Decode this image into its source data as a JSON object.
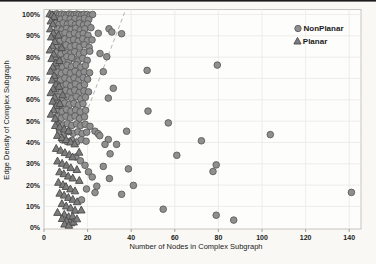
{
  "figure": {
    "width": 376,
    "height": 264,
    "background": "#f9f8f5",
    "top_rule_color": "#1b1b1b",
    "plot_background": "#fdfdfc",
    "plot_border_color": "#c6c4c0",
    "grid_color": "#ebe9e4",
    "tick_color": "#8b8b8b",
    "text_color": "#1a1a1a"
  },
  "chart_data": {
    "type": "scatter",
    "title": "",
    "xlabel": "Number of Nodes in Complex Subgraph",
    "ylabel": "Edge Density of Complex Subgraph",
    "xlim": [
      0,
      145
    ],
    "ylim": [
      0,
      102
    ],
    "x_ticks": [
      0,
      20,
      40,
      60,
      80,
      100,
      120,
      140
    ],
    "x_tick_labels": [
      "0",
      "20",
      "40",
      "60",
      "80",
      "100",
      "120",
      "140"
    ],
    "y_ticks": [
      0,
      10,
      20,
      30,
      40,
      50,
      60,
      70,
      80,
      90,
      100
    ],
    "y_tick_labels": [
      "0%",
      "10%",
      "20%",
      "30%",
      "40%",
      "50%",
      "60%",
      "70%",
      "80%",
      "90%",
      "100%"
    ],
    "grid": true,
    "legend": {
      "position": "top-right",
      "entries": [
        {
          "label": "NonPlanar",
          "marker": "circle"
        },
        {
          "label": "Planar",
          "marker": "triangle"
        }
      ]
    },
    "trend_line": {
      "style": "dashed",
      "color": "#b6b4b0",
      "x1": 13.5,
      "y1": 38,
      "x2": 37,
      "y2": 101
    },
    "series": [
      {
        "name": "NonPlanar",
        "marker": "circle",
        "fill": "#8f8f8f",
        "stroke": "#5c5c5c",
        "points": [
          [
            4.8,
            100
          ],
          [
            5.9,
            100.3
          ],
          [
            7,
            99.8
          ],
          [
            8.1,
            100.2
          ],
          [
            9.3,
            100
          ],
          [
            10.4,
            99.7
          ],
          [
            11.5,
            100.2
          ],
          [
            12.7,
            100
          ],
          [
            13.8,
            99.8
          ],
          [
            15,
            100.2
          ],
          [
            16.1,
            100
          ],
          [
            17.3,
            99.7
          ],
          [
            18.4,
            100.1
          ],
          [
            19.8,
            100
          ],
          [
            21.2,
            99.6
          ],
          [
            22.3,
            100
          ],
          [
            5.4,
            98.2
          ],
          [
            7.6,
            97.8
          ],
          [
            9.8,
            98.3
          ],
          [
            12,
            97.9
          ],
          [
            14.2,
            98.1
          ],
          [
            16.4,
            97.7
          ],
          [
            18.6,
            98.2
          ],
          [
            20.5,
            97.6
          ],
          [
            5.1,
            95.8
          ],
          [
            6.9,
            95.2
          ],
          [
            8.8,
            96
          ],
          [
            10.7,
            95.4
          ],
          [
            12.5,
            96.1
          ],
          [
            14.4,
            95.3
          ],
          [
            16.2,
            95.9
          ],
          [
            18.1,
            95.1
          ],
          [
            20,
            95.6
          ],
          [
            6.2,
            93.4
          ],
          [
            8.3,
            92.8
          ],
          [
            10.3,
            93.5
          ],
          [
            12.4,
            92.9
          ],
          [
            14.5,
            93.6
          ],
          [
            16.6,
            92.7
          ],
          [
            18.7,
            93.3
          ],
          [
            21.5,
            93.8
          ],
          [
            5.6,
            91.2
          ],
          [
            7.7,
            90.6
          ],
          [
            9.7,
            91.4
          ],
          [
            11.8,
            90.5
          ],
          [
            13.9,
            91.3
          ],
          [
            16,
            90.4
          ],
          [
            18,
            91.1
          ],
          [
            20.2,
            90.3
          ],
          [
            24.9,
            91.2
          ],
          [
            29.8,
            93.3
          ],
          [
            31.1,
            91.8
          ],
          [
            35.6,
            91
          ],
          [
            5.3,
            88.4
          ],
          [
            7.4,
            87.6
          ],
          [
            9.4,
            88.5
          ],
          [
            11.5,
            87.7
          ],
          [
            13.6,
            88.3
          ],
          [
            15.7,
            87.5
          ],
          [
            17.8,
            88.6
          ],
          [
            19.9,
            87.8
          ],
          [
            22,
            88.1
          ],
          [
            6,
            85.6
          ],
          [
            8.1,
            84.8
          ],
          [
            10.1,
            85.7
          ],
          [
            12.2,
            84.9
          ],
          [
            14.3,
            85.5
          ],
          [
            16.4,
            84.7
          ],
          [
            18.5,
            85.8
          ],
          [
            20.7,
            84.6
          ],
          [
            5.7,
            82.3
          ],
          [
            7.8,
            81.5
          ],
          [
            9.9,
            82.4
          ],
          [
            12,
            81.6
          ],
          [
            14.1,
            82.5
          ],
          [
            16.2,
            81.4
          ],
          [
            18.3,
            82.2
          ],
          [
            21,
            82.8
          ],
          [
            25.7,
            81.7
          ],
          [
            28.8,
            80.2
          ],
          [
            5.2,
            79.1
          ],
          [
            7.3,
            78.3
          ],
          [
            9.3,
            79.2
          ],
          [
            11.4,
            78.4
          ],
          [
            13.5,
            79.3
          ],
          [
            15.6,
            78.2
          ],
          [
            17.7,
            79.4
          ],
          [
            19.8,
            78.5
          ],
          [
            10.5,
            80.3
          ],
          [
            12.6,
            79.9
          ],
          [
            6.4,
            76.2
          ],
          [
            8.5,
            75.4
          ],
          [
            10.6,
            76.3
          ],
          [
            12.7,
            75.5
          ],
          [
            14.8,
            76.4
          ],
          [
            16.9,
            75.3
          ],
          [
            19,
            76.1
          ],
          [
            27.2,
            73.2
          ],
          [
            47.3,
            73.8
          ],
          [
            79.5,
            76.3
          ],
          [
            5.9,
            73.2
          ],
          [
            8,
            72.4
          ],
          [
            10,
            73.3
          ],
          [
            12.1,
            72.5
          ],
          [
            14.2,
            73.4
          ],
          [
            16.3,
            72.3
          ],
          [
            18.4,
            73.1
          ],
          [
            20.9,
            72.7
          ],
          [
            5.5,
            70.1
          ],
          [
            7.6,
            69.3
          ],
          [
            9.6,
            70.2
          ],
          [
            11.7,
            69.4
          ],
          [
            13.8,
            70.3
          ],
          [
            15.9,
            69.2
          ],
          [
            18,
            70.4
          ],
          [
            20,
            69.6
          ],
          [
            6.1,
            67.2
          ],
          [
            8.2,
            66.4
          ],
          [
            10.2,
            67.3
          ],
          [
            12.3,
            66.5
          ],
          [
            14.4,
            67.4
          ],
          [
            16.5,
            66.3
          ],
          [
            18.6,
            67.1
          ],
          [
            31.8,
            65.4
          ],
          [
            5.8,
            64.3
          ],
          [
            7.9,
            63.5
          ],
          [
            9.9,
            64.4
          ],
          [
            12,
            63.6
          ],
          [
            14.1,
            64.5
          ],
          [
            16.2,
            63.4
          ],
          [
            18.3,
            64.2
          ],
          [
            20.4,
            63.7
          ],
          [
            6.5,
            61.3
          ],
          [
            8.6,
            60.5
          ],
          [
            10.6,
            61.4
          ],
          [
            12.7,
            60.6
          ],
          [
            14.8,
            61.5
          ],
          [
            16.9,
            60.4
          ],
          [
            19,
            61.2
          ],
          [
            29.5,
            60.8
          ],
          [
            5.4,
            58.4
          ],
          [
            7.5,
            57.6
          ],
          [
            9.5,
            58.5
          ],
          [
            11.6,
            57.7
          ],
          [
            13.7,
            58.3
          ],
          [
            15.8,
            57.5
          ],
          [
            17.9,
            58.2
          ],
          [
            6.2,
            55.3
          ],
          [
            8.3,
            54.5
          ],
          [
            10.3,
            55.4
          ],
          [
            12.4,
            54.6
          ],
          [
            14.5,
            55.2
          ],
          [
            16.6,
            54.4
          ],
          [
            19.1,
            55.1
          ],
          [
            47.7,
            54.7
          ],
          [
            5.9,
            52.2
          ],
          [
            8,
            51.4
          ],
          [
            10,
            52.3
          ],
          [
            12.1,
            51.5
          ],
          [
            14.2,
            52.4
          ],
          [
            16.3,
            51.3
          ],
          [
            18.6,
            52
          ],
          [
            57,
            49.2
          ],
          [
            6.6,
            48.9
          ],
          [
            8.7,
            48.1
          ],
          [
            10.7,
            48.8
          ],
          [
            12.8,
            48
          ],
          [
            14.9,
            48.7
          ],
          [
            16.8,
            47.9
          ],
          [
            18.9,
            48.5
          ],
          [
            21.1,
            47.6
          ],
          [
            7.2,
            45.2
          ],
          [
            9.3,
            44.4
          ],
          [
            11.3,
            45.1
          ],
          [
            13.4,
            44.3
          ],
          [
            15.5,
            45
          ],
          [
            17.5,
            44.2
          ],
          [
            19.6,
            44.8
          ],
          [
            23.4,
            45.3
          ],
          [
            24.8,
            44.1
          ],
          [
            25.6,
            43.2
          ],
          [
            37.9,
            45.3
          ],
          [
            8.4,
            41.2
          ],
          [
            10.5,
            40.4
          ],
          [
            12.8,
            41
          ],
          [
            15,
            40.2
          ],
          [
            17.1,
            41.3
          ],
          [
            19.3,
            40.6
          ],
          [
            29.5,
            41.4
          ],
          [
            28,
            39.1
          ],
          [
            33.3,
            39.1
          ],
          [
            72.2,
            40.8
          ],
          [
            103.8,
            43.7
          ],
          [
            30.3,
            34.7
          ],
          [
            60.9,
            34
          ],
          [
            14.6,
            33.2
          ],
          [
            16.7,
            31.4
          ],
          [
            18.8,
            29.3
          ],
          [
            27.2,
            28.8
          ],
          [
            38.7,
            27.6
          ],
          [
            79,
            29.5
          ],
          [
            77.5,
            26.4
          ],
          [
            20.4,
            26.2
          ],
          [
            22.1,
            23.8
          ],
          [
            30,
            23.1
          ],
          [
            24.2,
            19.5
          ],
          [
            41,
            19.9
          ],
          [
            23.4,
            16.5
          ],
          [
            35.6,
            15.7
          ],
          [
            141,
            16.6
          ],
          [
            19.5,
            18.2
          ],
          [
            54.7,
            8.7
          ],
          [
            79,
            5.9
          ],
          [
            87,
            3.6
          ],
          [
            17.2,
            13.1
          ]
        ]
      },
      {
        "name": "Planar",
        "marker": "triangle",
        "fill": "#7c7c7c",
        "stroke": "#4a4a4a",
        "points": [
          [
            2.6,
            100.2
          ],
          [
            3.7,
            99.8
          ],
          [
            4.6,
            98.9
          ],
          [
            3.1,
            96.8
          ],
          [
            4.1,
            95.4
          ],
          [
            2.9,
            93.1
          ],
          [
            4.3,
            91.2
          ],
          [
            3.3,
            89.3
          ],
          [
            5,
            87.2
          ],
          [
            3.9,
            85.1
          ],
          [
            2.7,
            83.2
          ],
          [
            4.5,
            81.3
          ],
          [
            3.5,
            79.2
          ],
          [
            5.3,
            77.1
          ],
          [
            4,
            75.2
          ],
          [
            3,
            73.3
          ],
          [
            4.7,
            71.2
          ],
          [
            3.7,
            69.1
          ],
          [
            5.5,
            67.2
          ],
          [
            4.2,
            65.1
          ],
          [
            3.1,
            63.2
          ],
          [
            4.9,
            61.1
          ],
          [
            4,
            59.2
          ],
          [
            5.7,
            57.1
          ],
          [
            4.4,
            55.2
          ],
          [
            3.2,
            53.1
          ],
          [
            5.1,
            51.2
          ],
          [
            6.6,
            90.2
          ],
          [
            7.1,
            78.3
          ],
          [
            6.9,
            66.2
          ],
          [
            7.3,
            58.1
          ],
          [
            6.4,
            48.2
          ],
          [
            8.1,
            84.3
          ],
          [
            8.6,
            62.2
          ],
          [
            5.2,
            47.8
          ],
          [
            7.2,
            47.1
          ],
          [
            9.2,
            46.2
          ],
          [
            11.2,
            45.3
          ],
          [
            6.1,
            43.2
          ],
          [
            8.2,
            42.1
          ],
          [
            10.2,
            41.2
          ],
          [
            12.2,
            40.1
          ],
          [
            14.1,
            39.2
          ],
          [
            5.6,
            37.1
          ],
          [
            7.6,
            36.2
          ],
          [
            9.6,
            35.1
          ],
          [
            11.6,
            34.2
          ],
          [
            13.1,
            33.1
          ],
          [
            16.1,
            35.3
          ],
          [
            6.2,
            31.2
          ],
          [
            8.3,
            30.1
          ],
          [
            10.3,
            29.2
          ],
          [
            12.3,
            28.1
          ],
          [
            15.1,
            27.2
          ],
          [
            7.1,
            26.1
          ],
          [
            9.1,
            25.2
          ],
          [
            11.1,
            24.1
          ],
          [
            13.2,
            23.2
          ],
          [
            16.2,
            22.1
          ],
          [
            6.6,
            21.2
          ],
          [
            8.7,
            20.1
          ],
          [
            10.1,
            19.2
          ],
          [
            12.1,
            18.1
          ],
          [
            14.2,
            17.2
          ],
          [
            7.2,
            16.1
          ],
          [
            9.2,
            15.2
          ],
          [
            11.2,
            14.1
          ],
          [
            13.2,
            13.2
          ],
          [
            15.2,
            12.1
          ],
          [
            8.2,
            11.2
          ],
          [
            10.2,
            10.1
          ],
          [
            12.2,
            9.2
          ],
          [
            14.2,
            8.1
          ],
          [
            17.1,
            8.2
          ],
          [
            6.2,
            7.1
          ],
          [
            9.3,
            6.2
          ],
          [
            11.3,
            5.1
          ],
          [
            13.1,
            5.3
          ],
          [
            8.3,
            4.2
          ],
          [
            10.3,
            3.1
          ],
          [
            12.3,
            2.2
          ],
          [
            9.4,
            1.6
          ],
          [
            11.4,
            1.1
          ],
          [
            13.6,
            2.6
          ],
          [
            15.1,
            4.1
          ]
        ]
      }
    ]
  }
}
